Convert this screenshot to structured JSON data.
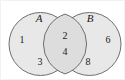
{
  "figure": {
    "type": "venn-diagram",
    "sets_count": 2,
    "background_color": "#ffffff",
    "circle_fill_color": "#e8e8e8",
    "circle_stroke_color": "#6f6f6f",
    "intersection_fill_color": "#dddddd",
    "text_color": "#1a1a1a"
  },
  "sets": [
    {
      "key": "A",
      "label": "A",
      "label_style": "italic",
      "exclusive_elements": [
        "1",
        "3"
      ]
    },
    {
      "key": "B",
      "label": "B",
      "label_style": "italic",
      "exclusive_elements": [
        "6",
        "8"
      ]
    }
  ],
  "intersection": {
    "label": "",
    "elements": [
      "2",
      "4"
    ]
  },
  "elements": {
    "a_only": {
      "upper": "1",
      "lower": "3"
    },
    "intersection": {
      "upper": "2",
      "lower": "4"
    },
    "b_only": {
      "upper": "6",
      "lower": "8"
    }
  }
}
